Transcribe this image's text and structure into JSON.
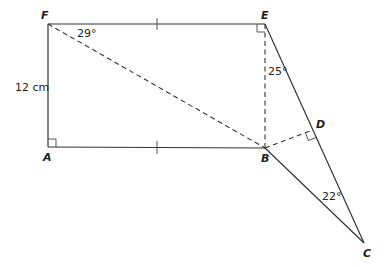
{
  "diagram": {
    "type": "geometry",
    "points": {
      "F": {
        "label": "F",
        "x": 48,
        "y": 24
      },
      "E": {
        "label": "E",
        "x": 265,
        "y": 24
      },
      "A": {
        "label": "A",
        "x": 48,
        "y": 147
      },
      "B": {
        "label": "B",
        "x": 265,
        "y": 148
      },
      "D": {
        "label": "D",
        "x": 313,
        "y": 130
      },
      "C": {
        "label": "C",
        "x": 364,
        "y": 243
      }
    },
    "labels": {
      "side_FA": "12 cm",
      "angle_EFB": "29°",
      "angle_BED": "25°",
      "angle_BCD": "22°"
    },
    "solid_segments": [
      "FE",
      "FA",
      "AB",
      "EC",
      "BC"
    ],
    "dashed_segments": [
      "FB",
      "EB",
      "BD"
    ],
    "right_angles": [
      "A",
      "E",
      "D"
    ],
    "equal_ticks": [
      "FE",
      "AB"
    ]
  }
}
